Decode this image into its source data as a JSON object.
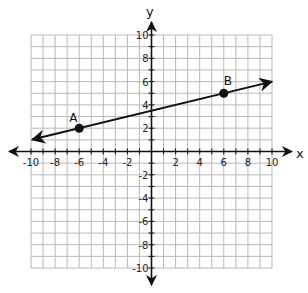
{
  "chart_data": {
    "type": "line",
    "title": "",
    "xlabel": "x",
    "ylabel": "y",
    "xlim": [
      -10,
      10
    ],
    "ylim": [
      -10,
      10
    ],
    "grid": true,
    "grid_step": 1,
    "x_ticks": [
      -10,
      -8,
      -6,
      -4,
      -2,
      2,
      4,
      6,
      8,
      10
    ],
    "y_ticks": [
      -10,
      -8,
      -6,
      -4,
      -2,
      2,
      4,
      6,
      8,
      10
    ],
    "x_tick_labels": [
      "-10",
      "-8",
      "-6",
      "-4",
      "-2",
      "2",
      "4",
      "6",
      "8",
      "10"
    ],
    "y_tick_labels": [
      "-10",
      "-8",
      "-6",
      "-4",
      "-2",
      "2",
      "4",
      "6",
      "8",
      "10"
    ],
    "points": [
      {
        "label": "A",
        "x": -6,
        "y": 2
      },
      {
        "label": "B",
        "x": 6,
        "y": 5
      }
    ],
    "line": {
      "description": "line through A and B with arrows at both ends",
      "slope": 0.25,
      "intercept": 3.5,
      "x_start": -10,
      "x_end": 10
    }
  },
  "colors": {
    "grid": "#b8b8b8",
    "axis": "#111111",
    "line": "#111111",
    "point": "#111111",
    "background": "#ffffff"
  }
}
